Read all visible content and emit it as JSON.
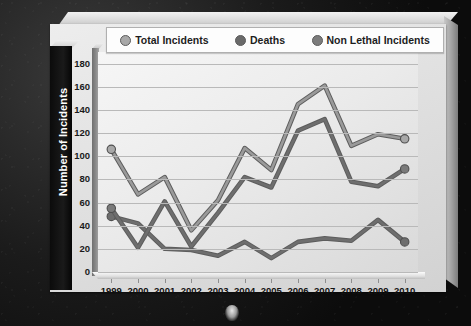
{
  "chart_data": {
    "type": "line",
    "title": "",
    "xlabel": "",
    "ylabel": "Number of Incidents",
    "categories": [
      "1999",
      "2000",
      "2001",
      "2002",
      "2003",
      "2004",
      "2005",
      "2006",
      "2007",
      "2008",
      "2009",
      "2010"
    ],
    "ylim": [
      0,
      190
    ],
    "yticks": [
      0,
      20,
      40,
      60,
      80,
      100,
      120,
      140,
      160,
      180
    ],
    "grid": true,
    "legend_position": "top",
    "series": [
      {
        "name": "Total Incidents",
        "color": "#9a9a9a",
        "marker_color": "#a8a8a8",
        "values": [
          106,
          67,
          82,
          36,
          62,
          107,
          88,
          145,
          161,
          109,
          119,
          115
        ]
      },
      {
        "name": "Deaths",
        "color": "#6e6e6e",
        "marker_color": "#6e6e6e",
        "values": [
          48,
          42,
          20,
          19,
          14,
          26,
          12,
          26,
          29,
          27,
          45,
          26
        ]
      },
      {
        "name": "Non Lethal Incidents",
        "color": "#6e6e6e",
        "marker_color": "#7a7a7a",
        "values": [
          55,
          21,
          61,
          22,
          51,
          82,
          73,
          122,
          132,
          78,
          74,
          89
        ]
      }
    ]
  },
  "legend": {
    "items": [
      {
        "label": "Total Incidents",
        "swatch": "#a8a8a8"
      },
      {
        "label": "Deaths",
        "swatch": "#6a6a6a"
      },
      {
        "label": "Non Lethal Incidents",
        "swatch": "#7c7c7c"
      }
    ]
  },
  "axis": {
    "y_title": "Number of Incidents",
    "y_labels": [
      "180",
      "160",
      "140",
      "120",
      "100",
      "80",
      "60",
      "40",
      "20",
      "0"
    ],
    "x_labels": [
      "1999",
      "2000",
      "2001",
      "2002",
      "2003",
      "2004",
      "2005",
      "2006",
      "2007",
      "2008",
      "2009",
      "2010"
    ]
  }
}
